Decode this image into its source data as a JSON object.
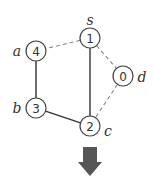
{
  "nodes": [
    {
      "id": "s",
      "label": "s",
      "value": "1",
      "x": 90,
      "y": 38,
      "lx": 90,
      "ly": 20
    },
    {
      "id": "a",
      "label": "a",
      "value": "4",
      "x": 36,
      "y": 51,
      "lx": 17,
      "ly": 51
    },
    {
      "id": "d",
      "label": "d",
      "value": "0",
      "x": 123,
      "y": 76,
      "lx": 142,
      "ly": 77
    },
    {
      "id": "b",
      "label": "b",
      "value": "3",
      "x": 36,
      "y": 108,
      "lx": 17,
      "ly": 108
    },
    {
      "id": "c",
      "label": "c",
      "value": "2",
      "x": 90,
      "y": 126,
      "lx": 108,
      "ly": 131
    }
  ],
  "edges": [
    {
      "from": "s",
      "to": "a",
      "style": "dashed"
    },
    {
      "from": "s",
      "to": "d",
      "style": "dashed"
    },
    {
      "from": "d",
      "to": "c",
      "style": "dashed"
    },
    {
      "from": "s",
      "to": "c",
      "style": "solid"
    },
    {
      "from": "a",
      "to": "b",
      "style": "solid"
    },
    {
      "from": "b",
      "to": "c",
      "style": "solid"
    }
  ],
  "arrow": {
    "direction": "down",
    "color": "#555555"
  }
}
